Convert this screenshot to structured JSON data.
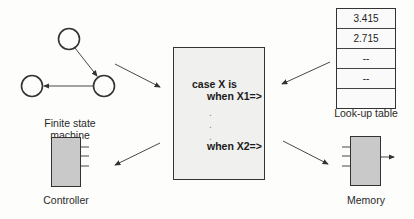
{
  "diagram": {
    "center": {
      "lines": [
        "case X is",
        "when X1=>",
        ".",
        ".",
        ".",
        "when X2=>"
      ]
    },
    "fsm": {
      "label_line1": "Finite state",
      "label_line2": "machine"
    },
    "lookup_table": {
      "label": "Look-up table",
      "rows": [
        "3.415",
        "2.715",
        "--",
        "--",
        ""
      ]
    },
    "controller": {
      "label": "Controller"
    },
    "memory": {
      "label": "Memory"
    },
    "colors": {
      "block_fill": "#c9c9c9",
      "box_fill": "#f0f0ee",
      "stroke": "#333333"
    }
  }
}
